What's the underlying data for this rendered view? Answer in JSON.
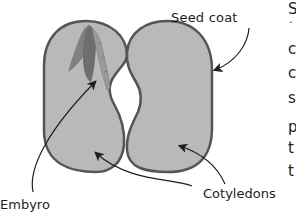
{
  "diagram": {
    "labels": {
      "seed_coat": "Seed coat",
      "embryo": "Embyro",
      "cotyledons": "Cotyledons"
    },
    "edge_text_fragments": [
      "S",
      ".",
      "c",
      "c",
      "s",
      "p",
      "t",
      "t"
    ],
    "colors": {
      "cotyledon_fill": "#b9b9b9",
      "outline": "#555555",
      "embryo_dark": "#6e6e6e",
      "embryo_light": "#9a9a9a",
      "text": "#1e1e1e",
      "background": "#ffffff"
    }
  }
}
